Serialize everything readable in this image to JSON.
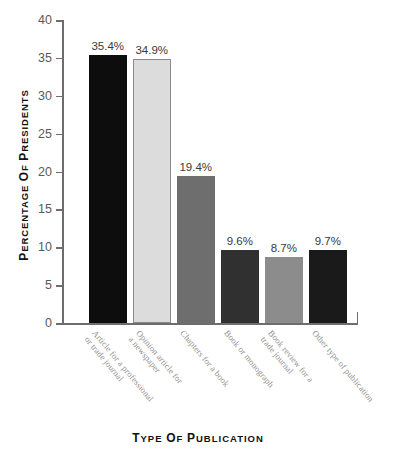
{
  "chart_data": {
    "type": "bar",
    "title": "",
    "subtitle": "",
    "xlabel": "TYPE OF PUBLICATION",
    "ylabel": "PERCENTAGE OF PRESIDENTS",
    "categories": [
      "Article for a professional or trade journal",
      "Opinion article for a newspaper",
      "Chapters for a book",
      "Book or monograph",
      "Book review for a trade journal",
      "Other type of publication"
    ],
    "category_lines": [
      [
        "Article for a professional",
        "or trade journal"
      ],
      [
        "Opinion article for",
        "a newspaper"
      ],
      [
        "Chapters for a book"
      ],
      [
        "Book or monograph"
      ],
      [
        "Book review for a",
        "trade journal"
      ],
      [
        "Other type of publication"
      ]
    ],
    "values": [
      35.4,
      34.9,
      19.4,
      9.6,
      8.7,
      9.7
    ],
    "data_labels": [
      "35.4%",
      "34.9%",
      "19.4%",
      "9.6%",
      "8.7%",
      "9.7%"
    ],
    "bar_colors": [
      "#0d0d0d",
      "#dcdcdc",
      "#6e6e6e",
      "#303030",
      "#8c8c8c",
      "#1a1a1a"
    ],
    "bar_border_colors": [
      "#0d0d0d",
      "#8a8a8a",
      "#6e6e6e",
      "#303030",
      "#8c8c8c",
      "#1a1a1a"
    ],
    "ylim": [
      0,
      40
    ],
    "yticks": [
      0,
      5,
      10,
      15,
      20,
      25,
      30,
      35,
      40
    ],
    "ytick_labels": [
      "0",
      "5",
      "10",
      "15",
      "20",
      "25",
      "30",
      "35",
      "40"
    ],
    "grid": false,
    "legend": null,
    "axis_color": "#6d6d6d"
  },
  "yaxis_title": {
    "first_cap": "P",
    "rest_1": "ERCENTAGE",
    "of_cap": "O",
    "of_rest": "F",
    "second_cap": "P",
    "rest_2": "RESIDENTS"
  },
  "xaxis_title": {
    "first_cap": "T",
    "rest_1": "YPE",
    "of_cap": "O",
    "of_rest": "F",
    "second_cap": "P",
    "rest_2": "UBLICATION"
  }
}
